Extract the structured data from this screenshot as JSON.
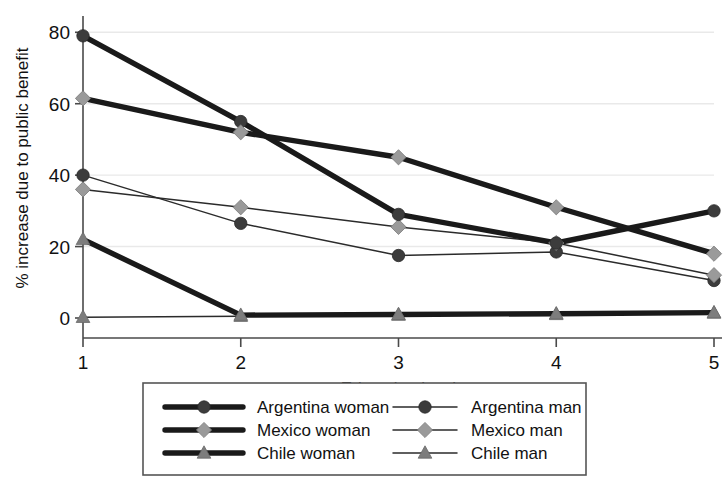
{
  "chart_data": {
    "type": "line",
    "title": "",
    "xlabel": "Education level",
    "ylabel": "% increase due to public benefit",
    "x": [
      1,
      2,
      3,
      4,
      5
    ],
    "xtick_labels": [
      "1",
      "2",
      "3",
      "4",
      "5"
    ],
    "ytick_labels": [
      "0",
      "20",
      "40",
      "60",
      "80"
    ],
    "yticks": [
      0,
      20,
      40,
      60,
      80
    ],
    "xlim": [
      1,
      5
    ],
    "ylim": [
      0,
      84
    ],
    "grid": "horizontal-faint",
    "legend_position": "below-plot",
    "series": [
      {
        "name": "Argentina woman",
        "values": [
          79,
          55,
          29,
          21,
          30
        ],
        "marker": "circle",
        "marker_color": "#3c3c3c",
        "line_color": "#1a1a1a",
        "line_weight": "thick"
      },
      {
        "name": "Mexico woman",
        "values": [
          61.5,
          52,
          45,
          31,
          18
        ],
        "marker": "diamond",
        "marker_color": "#9a9a9a",
        "line_color": "#1a1a1a",
        "line_weight": "thick"
      },
      {
        "name": "Chile woman",
        "values": [
          22,
          0.8,
          1,
          1.2,
          1.5
        ],
        "marker": "triangle",
        "marker_color": "#7d7d7d",
        "line_color": "#1a1a1a",
        "line_weight": "thick"
      },
      {
        "name": "Argentina man",
        "values": [
          40,
          26.5,
          17.5,
          18.5,
          10.5
        ],
        "marker": "circle",
        "marker_color": "#3c3c3c",
        "line_color": "#2b2b2b",
        "line_weight": "thin"
      },
      {
        "name": "Mexico man",
        "values": [
          36,
          31,
          25.5,
          21,
          12
        ],
        "marker": "diamond",
        "marker_color": "#9a9a9a",
        "line_color": "#2b2b2b",
        "line_weight": "thin"
      },
      {
        "name": "Chile man",
        "values": [
          0.2,
          0.5,
          0.8,
          1.0,
          1.4
        ],
        "marker": "triangle",
        "marker_color": "#7d7d7d",
        "line_color": "#2b2b2b",
        "line_weight": "thin"
      }
    ]
  },
  "legend": {
    "column_left": [
      "Argentina woman",
      "Mexico woman",
      "Chile woman"
    ],
    "column_right": [
      "Argentina man",
      "Mexico man",
      "Chile man"
    ]
  },
  "colors": {
    "background": "#ffffff",
    "axis": "#4a4a4a",
    "grid": "#e9e9e9",
    "thick_line": "#1a1a1a",
    "thin_line": "#2b2b2b",
    "marker_circle": "#3c3c3c",
    "marker_diamond": "#9a9a9a",
    "marker_triangle": "#7d7d7d",
    "text": "#111111"
  }
}
